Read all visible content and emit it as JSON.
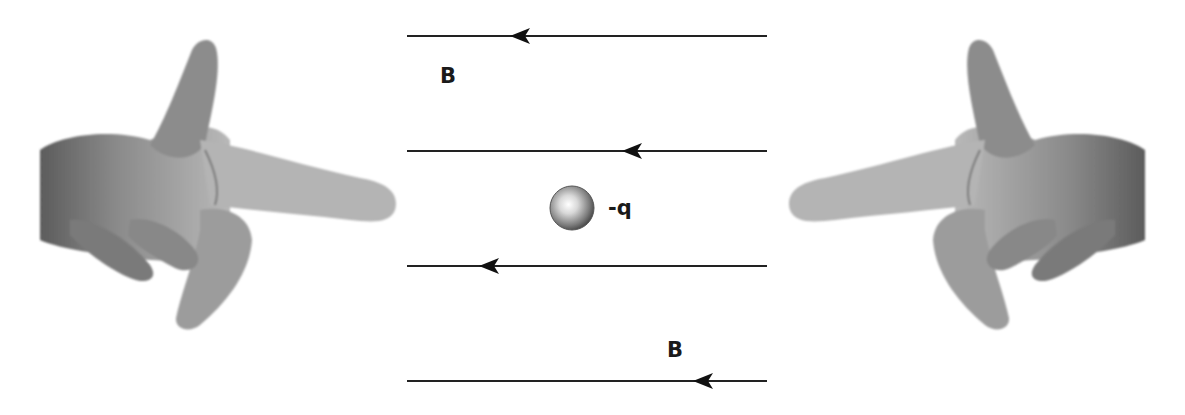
{
  "diagram": {
    "field_label_top": "B",
    "field_label_bottom": "B",
    "charge_label": "-q",
    "field_direction": "left",
    "field_lines": [
      {
        "y": 36,
        "x1": 407,
        "x2": 767,
        "arrow_x": 512
      },
      {
        "y": 151,
        "x1": 407,
        "x2": 767,
        "arrow_x": 624
      },
      {
        "y": 266,
        "x1": 407,
        "x2": 767,
        "arrow_x": 481
      },
      {
        "y": 381,
        "x1": 407,
        "x2": 767,
        "arrow_x": 695
      }
    ],
    "charge": {
      "cx": 572,
      "cy": 208,
      "r": 22
    },
    "hands": [
      {
        "side": "left",
        "pointing": "right",
        "description": "left hand pointing index finger right, thumb up, middle finger down"
      },
      {
        "side": "right",
        "pointing": "left",
        "description": "right hand pointing index finger left, thumb up, middle finger down"
      }
    ],
    "colors": {
      "line": "#222222",
      "text": "#1a1a1a",
      "skin_dark": "#6e6e6e",
      "skin_mid": "#9a9a9a",
      "skin_light": "#c8c8c8"
    }
  }
}
